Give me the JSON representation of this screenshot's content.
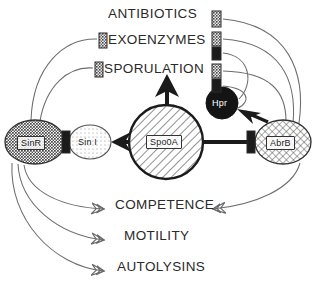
{
  "diagram": {
    "type": "biological-regulatory-network",
    "background": "#ffffff",
    "line_color": "#555555",
    "text_color": "#2a2a2a"
  },
  "outputs": [
    {
      "id": "antibiotics",
      "label": "ANTIBIOTICS",
      "x": 108,
      "y": 13
    },
    {
      "id": "exoenzymes",
      "label": "EXOENZYMES",
      "x": 108,
      "y": 39
    },
    {
      "id": "sporulation",
      "label": "SPORULATION",
      "x": 104,
      "y": 68
    },
    {
      "id": "competence",
      "label": "COMPETENCE",
      "x": 115,
      "y": 204
    },
    {
      "id": "motility",
      "label": "MOTILITY",
      "x": 124,
      "y": 235
    },
    {
      "id": "autolysins",
      "label": "AUTOLYSINS",
      "x": 117,
      "y": 266
    }
  ],
  "nodes": [
    {
      "id": "spo0a",
      "label": "Spo0A",
      "shape": "circle",
      "fill": "hatch-diagonal",
      "cx": 166,
      "cy": 142,
      "rx": 37,
      "ry": 37,
      "text_style": "boxed"
    },
    {
      "id": "sinr",
      "label": "SinR",
      "shape": "ellipse",
      "fill": "stipple-dark",
      "cx": 35,
      "cy": 142,
      "rx": 30,
      "ry": 22,
      "text_style": "boxed"
    },
    {
      "id": "sini",
      "label": "Sin I",
      "shape": "ellipse",
      "fill": "stipple-light",
      "cx": 90,
      "cy": 142,
      "rx": 21,
      "ry": 17,
      "text_style": "plain"
    },
    {
      "id": "abrb",
      "label": "AbrB",
      "shape": "ellipse",
      "fill": "crosshatch",
      "cx": 283,
      "cy": 142,
      "rx": 28,
      "ry": 22,
      "text_style": "boxed"
    },
    {
      "id": "hpr",
      "label": "Hpr",
      "shape": "circle",
      "fill": "solid-black",
      "cx": 222,
      "cy": 103,
      "rx": 17,
      "ry": 15,
      "text_style": "inverse"
    }
  ],
  "inhibition_bars": [
    {
      "id": "bar-sinr-exoenzymes",
      "target": "exoenzymes",
      "fill": "stipple",
      "x": 99,
      "y": 33,
      "w": 8,
      "h": 15
    },
    {
      "id": "bar-sinr-sporulation",
      "target": "sporulation",
      "fill": "stipple",
      "x": 95,
      "y": 62,
      "w": 8,
      "h": 15
    },
    {
      "id": "bar-abrb-antibiotics",
      "target": "antibiotics",
      "fill": "stipple",
      "x": 212,
      "y": 11,
      "w": 9,
      "h": 16
    },
    {
      "id": "bar-abrb-exoenzymes",
      "target": "exoenzymes",
      "fill": "stipple",
      "x": 212,
      "y": 32,
      "w": 9,
      "h": 14
    },
    {
      "id": "bar-hpr-exoenzymes",
      "target": "exoenzymes",
      "fill": "solid",
      "x": 212,
      "y": 47,
      "w": 9,
      "h": 13
    },
    {
      "id": "bar-abrb-sporulation",
      "target": "sporulation",
      "fill": "stipple",
      "x": 212,
      "y": 64,
      "w": 9,
      "h": 14
    },
    {
      "id": "bar-hpr-sporulation",
      "target": "sporulation",
      "fill": "solid",
      "x": 212,
      "y": 79,
      "w": 9,
      "h": 13
    },
    {
      "id": "bar-spo0a-sinr",
      "target": "sinr",
      "fill": "solid",
      "x": 62,
      "y": 131,
      "w": 8,
      "h": 22
    },
    {
      "id": "bar-spo0a-abrb",
      "target": "abrb",
      "fill": "solid",
      "x": 247,
      "y": 131,
      "w": 8,
      "h": 22
    }
  ],
  "edges": [
    {
      "id": "spo0a-to-sporulation",
      "from": "spo0a",
      "to": "sporulation",
      "kind": "activation",
      "style": "thick-solid"
    },
    {
      "id": "spo0a-to-sini",
      "from": "spo0a",
      "to": "sini",
      "kind": "activation",
      "style": "thick-solid"
    },
    {
      "id": "spo0a-to-abrb",
      "from": "spo0a",
      "to": "abrb",
      "kind": "inhibition",
      "style": "thick-solid"
    },
    {
      "id": "sini-to-sinr",
      "from": "sini",
      "to": "sinr",
      "kind": "inhibition",
      "style": "thick-solid"
    },
    {
      "id": "abrb-to-hpr",
      "from": "abrb",
      "to": "hpr",
      "kind": "activation",
      "style": "thick-solid"
    },
    {
      "id": "sinr-to-exoenzymes",
      "from": "sinr",
      "to": "exoenzymes",
      "kind": "inhibition",
      "style": "thin-curve"
    },
    {
      "id": "sinr-to-sporulation",
      "from": "sinr",
      "to": "sporulation",
      "kind": "inhibition",
      "style": "thin-curve"
    },
    {
      "id": "abrb-to-antibiotics",
      "from": "abrb",
      "to": "antibiotics",
      "kind": "inhibition",
      "style": "thin-curve"
    },
    {
      "id": "abrb-to-exoenzymes",
      "from": "abrb",
      "to": "exoenzymes",
      "kind": "inhibition",
      "style": "thin-curve"
    },
    {
      "id": "abrb-to-sporulation",
      "from": "abrb",
      "to": "sporulation",
      "kind": "inhibition",
      "style": "thin-curve"
    },
    {
      "id": "hpr-to-exoenzymes",
      "from": "hpr",
      "to": "exoenzymes",
      "kind": "inhibition",
      "style": "thin-curve"
    },
    {
      "id": "hpr-to-sporulation",
      "from": "hpr",
      "to": "sporulation",
      "kind": "inhibition",
      "style": "thin-curve"
    },
    {
      "id": "sinr-to-competence",
      "from": "sinr",
      "to": "competence",
      "kind": "activation",
      "style": "thin-curve"
    },
    {
      "id": "sinr-to-motility",
      "from": "sinr",
      "to": "motility",
      "kind": "activation",
      "style": "thin-curve"
    },
    {
      "id": "sinr-to-autolysins",
      "from": "sinr",
      "to": "autolysins",
      "kind": "activation",
      "style": "thin-curve"
    },
    {
      "id": "abrb-to-competence",
      "from": "abrb",
      "to": "competence",
      "kind": "activation",
      "style": "thin-curve"
    }
  ]
}
